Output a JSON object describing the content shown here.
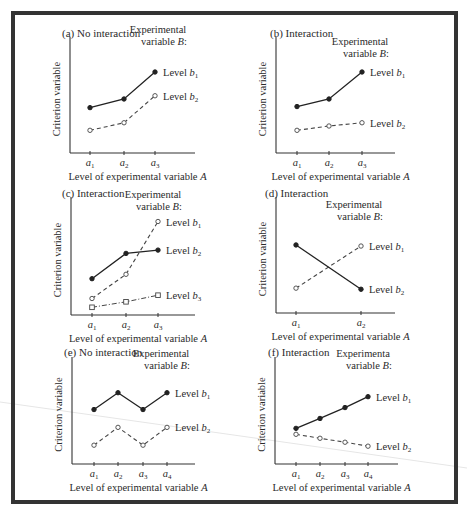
{
  "figure": {
    "legend_heading_line1": "Experimental",
    "legend_heading_line1_alt": "Experimenta",
    "legend_heading_line2": "variable B:",
    "ylabel": "Criterion variable",
    "xlabel": "Level of experimental variable A"
  },
  "chart_data": [
    {
      "type": "line",
      "id": "a",
      "title": "(a) No interaction",
      "xlabel": "Level of experimental variable A",
      "ylabel": "Criterion variable",
      "legend_title": "Experimental variable B:",
      "categories": [
        "a1",
        "a2",
        "a3"
      ],
      "ylim": [
        0,
        10
      ],
      "grid": false,
      "series": [
        {
          "name": "Level b1",
          "style": "solid",
          "marker": "filled-circle",
          "values": [
            4.2,
            5.0,
            7.5
          ]
        },
        {
          "name": "Level b2",
          "style": "dashed",
          "marker": "open-circle",
          "values": [
            2.1,
            2.8,
            5.3
          ]
        }
      ]
    },
    {
      "type": "line",
      "id": "b",
      "title": "(b) Interaction",
      "xlabel": "Level of experimental variable A",
      "ylabel": "Criterion variable",
      "legend_title": "Experimental variable B:",
      "categories": [
        "a1",
        "a2",
        "a3"
      ],
      "ylim": [
        0,
        10
      ],
      "grid": false,
      "series": [
        {
          "name": "Level b1",
          "style": "solid",
          "marker": "filled-circle",
          "values": [
            4.3,
            5.0,
            7.5
          ]
        },
        {
          "name": "Level b2",
          "style": "dashed",
          "marker": "open-circle",
          "values": [
            2.1,
            2.5,
            2.8
          ]
        }
      ]
    },
    {
      "type": "line",
      "id": "c",
      "title": "(c) Interaction",
      "xlabel": "Level of experimental variable A",
      "ylabel": "Criterion variable",
      "legend_title": "Experimental variable B:",
      "categories": [
        "a1",
        "a2",
        "a3"
      ],
      "ylim": [
        0,
        10
      ],
      "grid": false,
      "series": [
        {
          "name": "Level b1",
          "style": "dashed",
          "marker": "open-circle",
          "values": [
            1.5,
            3.7,
            8.5
          ]
        },
        {
          "name": "Level b2",
          "style": "solid",
          "marker": "filled-circle",
          "values": [
            3.3,
            5.6,
            5.9
          ]
        },
        {
          "name": "Level b3",
          "style": "dash-dot",
          "marker": "open-square",
          "values": [
            0.7,
            1.2,
            1.8
          ]
        }
      ]
    },
    {
      "type": "line",
      "id": "d",
      "title": "(d) Interaction",
      "xlabel": "Level of experimental variable A",
      "ylabel": "Criterion variable",
      "legend_title": "Experimental variable B:",
      "categories": [
        "a1",
        "a2"
      ],
      "ylim": [
        0,
        10
      ],
      "grid": false,
      "series": [
        {
          "name": "Level b1",
          "style": "dashed",
          "marker": "open-circle",
          "values": [
            2.3,
            6.2
          ]
        },
        {
          "name": "Level b2",
          "style": "solid",
          "marker": "filled-circle",
          "values": [
            6.3,
            2.2
          ]
        }
      ]
    },
    {
      "type": "line",
      "id": "e",
      "title": "(e) No interaction",
      "xlabel": "Level of experimental variable A",
      "ylabel": "Criterion variable",
      "legend_title": "Experimental variable B:",
      "categories": [
        "a1",
        "a2",
        "a3",
        "a4"
      ],
      "ylim": [
        0,
        10
      ],
      "grid": false,
      "series": [
        {
          "name": "Level b1",
          "style": "solid",
          "marker": "filled-circle",
          "values": [
            5.5,
            7.2,
            5.5,
            7.2
          ]
        },
        {
          "name": "Level b2",
          "style": "dashed",
          "marker": "open-circle",
          "values": [
            1.9,
            3.7,
            1.9,
            3.7
          ]
        }
      ]
    },
    {
      "type": "line",
      "id": "f",
      "title": "(f) Interaction",
      "xlabel": "Level of experimental variable A",
      "ylabel": "Criterion variable",
      "legend_title": "Experimental variable B:",
      "categories": [
        "a1",
        "a2",
        "a3",
        "a4"
      ],
      "ylim": [
        0,
        10
      ],
      "grid": false,
      "series": [
        {
          "name": "Level b1",
          "style": "solid",
          "marker": "filled-circle",
          "values": [
            3.6,
            4.6,
            5.7,
            6.8
          ]
        },
        {
          "name": "Level b2",
          "style": "dashed",
          "marker": "open-circle",
          "values": [
            3.0,
            2.6,
            2.2,
            1.8
          ]
        }
      ]
    }
  ]
}
